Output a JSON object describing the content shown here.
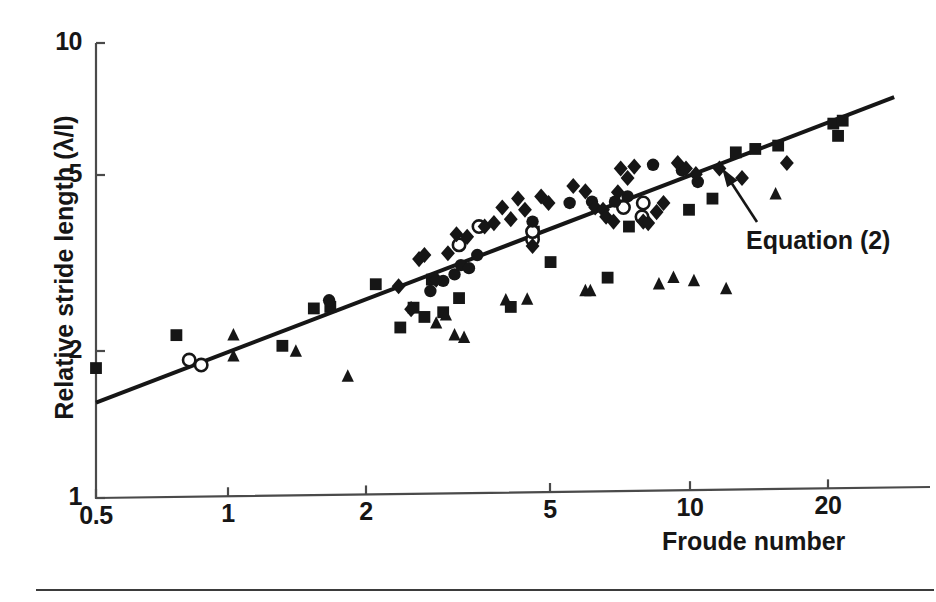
{
  "figure": {
    "background": "#ffffff",
    "ink_color": "#161616"
  },
  "chart_data": {
    "type": "scatter",
    "title": "",
    "xlabel": "Froude number",
    "ylabel": "Relative stride length (λ/l)",
    "xscale": "log",
    "yscale": "log",
    "xlim": [
      0.5,
      30
    ],
    "ylim": [
      1,
      10
    ],
    "grid": false,
    "legend": "none",
    "xticks": [
      "0.5",
      "1",
      "2",
      "5",
      "10",
      "20"
    ],
    "xtick_values": [
      0.5,
      1,
      2,
      5,
      10,
      20
    ],
    "yticks": [
      "1",
      "2",
      "5",
      "10"
    ],
    "ytick_values": [
      1,
      2,
      5,
      10
    ],
    "annotations": [
      {
        "text": "Equation (2)",
        "points_to": "fitted-line",
        "arrow": true
      }
    ],
    "fit_line": {
      "name": "Equation (2)",
      "x_start": 0.5,
      "y_start": 1.62,
      "x_end": 28.0,
      "y_end": 7.6,
      "style": "solid",
      "color": "#161616"
    },
    "series": [
      {
        "name": "filled-square",
        "marker": "square",
        "fill": "filled",
        "points": [
          [
            0.5,
            1.93
          ],
          [
            0.75,
            2.28
          ],
          [
            1.28,
            2.16
          ],
          [
            1.5,
            2.61
          ],
          [
            1.63,
            2.63
          ],
          [
            2.05,
            2.95
          ],
          [
            2.32,
            2.37
          ],
          [
            2.48,
            2.62
          ],
          [
            2.62,
            2.5
          ],
          [
            2.72,
            3.02
          ],
          [
            2.88,
            2.56
          ],
          [
            3.12,
            2.75
          ],
          [
            4.05,
            2.63
          ],
          [
            4.55,
            3.85
          ],
          [
            4.95,
            3.3
          ],
          [
            6.6,
            3.05
          ],
          [
            7.35,
            3.95
          ],
          [
            9.95,
            4.3
          ],
          [
            11.2,
            4.55
          ],
          [
            12.6,
            5.75
          ],
          [
            13.9,
            5.85
          ],
          [
            15.6,
            5.95
          ],
          [
            20.6,
            6.65
          ],
          [
            21.6,
            6.75
          ],
          [
            21.1,
            6.25
          ]
        ]
      },
      {
        "name": "filled-triangle",
        "marker": "triangle",
        "fill": "filled",
        "points": [
          [
            1.0,
            2.05
          ],
          [
            1.0,
            2.28
          ],
          [
            1.37,
            2.1
          ],
          [
            1.78,
            1.85
          ],
          [
            2.78,
            2.42
          ],
          [
            2.92,
            2.52
          ],
          [
            3.05,
            2.28
          ],
          [
            3.2,
            2.25
          ],
          [
            3.95,
            2.72
          ],
          [
            4.4,
            2.73
          ],
          [
            5.9,
            2.85
          ],
          [
            6.05,
            2.85
          ],
          [
            8.55,
            2.95
          ],
          [
            9.2,
            3.05
          ],
          [
            10.2,
            3.0
          ],
          [
            12.0,
            2.88
          ],
          [
            15.4,
            4.65
          ]
        ]
      },
      {
        "name": "open-circle",
        "marker": "circle",
        "fill": "open",
        "points": [
          [
            0.8,
            2.01
          ],
          [
            0.85,
            1.96
          ],
          [
            3.12,
            3.6
          ],
          [
            3.45,
            3.95
          ],
          [
            4.52,
            3.7
          ],
          [
            4.52,
            3.85
          ],
          [
            7.15,
            4.35
          ],
          [
            7.85,
            4.15
          ],
          [
            7.9,
            4.45
          ]
        ]
      },
      {
        "name": "filled-circle",
        "marker": "circle",
        "fill": "filled",
        "points": [
          [
            1.62,
            2.72
          ],
          [
            2.7,
            2.85
          ],
          [
            2.88,
            3.0
          ],
          [
            3.05,
            3.1
          ],
          [
            3.15,
            3.25
          ],
          [
            3.28,
            3.2
          ],
          [
            3.42,
            3.42
          ],
          [
            4.52,
            4.05
          ],
          [
            5.45,
            4.45
          ],
          [
            6.1,
            4.48
          ],
          [
            6.85,
            4.48
          ],
          [
            7.3,
            4.6
          ],
          [
            8.3,
            5.4
          ],
          [
            9.6,
            5.25
          ],
          [
            10.4,
            4.95
          ]
        ]
      },
      {
        "name": "filled-diamond",
        "marker": "diamond",
        "fill": "filled",
        "points": [
          [
            2.3,
            2.92
          ],
          [
            2.45,
            2.6
          ],
          [
            2.55,
            3.35
          ],
          [
            2.62,
            3.42
          ],
          [
            2.78,
            3.02
          ],
          [
            2.95,
            3.45
          ],
          [
            3.08,
            3.8
          ],
          [
            3.25,
            3.75
          ],
          [
            3.55,
            3.95
          ],
          [
            3.72,
            4.02
          ],
          [
            3.88,
            4.35
          ],
          [
            4.05,
            4.1
          ],
          [
            4.2,
            4.55
          ],
          [
            4.35,
            4.3
          ],
          [
            4.52,
            3.58
          ],
          [
            4.72,
            4.6
          ],
          [
            4.9,
            4.45
          ],
          [
            5.55,
            4.85
          ],
          [
            5.9,
            4.72
          ],
          [
            6.2,
            4.35
          ],
          [
            6.45,
            4.3
          ],
          [
            6.55,
            4.15
          ],
          [
            6.8,
            4.05
          ],
          [
            6.95,
            4.7
          ],
          [
            7.05,
            5.3
          ],
          [
            7.3,
            5.05
          ],
          [
            7.55,
            5.35
          ],
          [
            7.9,
            4.05
          ],
          [
            8.1,
            4.02
          ],
          [
            8.45,
            4.25
          ],
          [
            8.75,
            4.45
          ],
          [
            9.4,
            5.45
          ],
          [
            9.8,
            5.3
          ],
          [
            10.3,
            5.15
          ],
          [
            11.6,
            5.3
          ],
          [
            13.0,
            5.05
          ],
          [
            16.3,
            5.45
          ]
        ]
      }
    ]
  },
  "axes": {
    "x_tick_labels": [
      {
        "text": "0.5",
        "x": 96
      },
      {
        "text": "1",
        "x": 228
      },
      {
        "text": "2",
        "x": 366
      },
      {
        "text": "5",
        "x": 550
      },
      {
        "text": "10",
        "x": 690
      },
      {
        "text": "20",
        "x": 828
      }
    ],
    "y_tick_labels": [
      {
        "text": "10",
        "y": 43
      },
      {
        "text": "5",
        "y": 175
      },
      {
        "text": "2",
        "y": 351
      },
      {
        "text": "1",
        "y": 498
      }
    ]
  },
  "labels": {
    "x_axis_title": "Froude number",
    "y_axis_title": "Relative stride length (λ/l)",
    "equation_annotation": "Equation (2)"
  }
}
